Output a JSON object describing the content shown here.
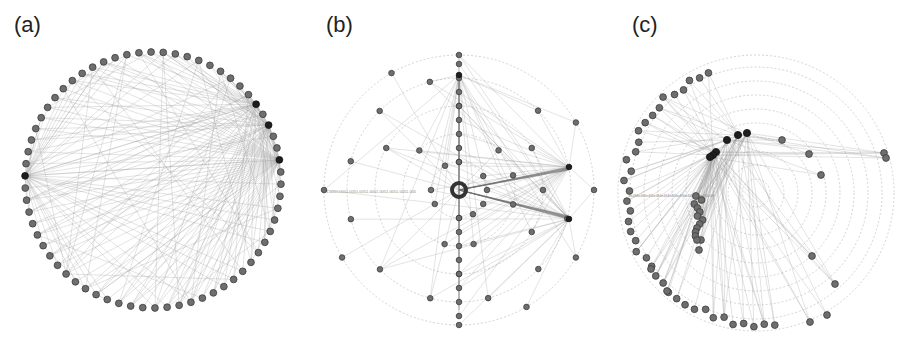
{
  "figure": {
    "panels": [
      {
        "id": "a",
        "label": "(a)",
        "layout": "circular"
      },
      {
        "id": "b",
        "label": "(b)",
        "layout": "radial-concentric"
      },
      {
        "id": "c",
        "label": "(c)",
        "layout": "radial-clustered"
      }
    ]
  },
  "colors": {
    "node": "#6e6e6e",
    "hub": "#1e1e1e",
    "edge": "#9a9a9a",
    "ring": "#c8c8c8",
    "background": "#ffffff"
  },
  "panel_a": {
    "center": [
      153,
      180
    ],
    "radius": 128,
    "node_count": 66,
    "hub_indices": [
      9,
      11,
      14,
      49
    ]
  },
  "panel_b": {
    "center": [
      459,
      190
    ],
    "ring_radii": [
      28,
      56,
      84,
      112,
      135
    ],
    "hubs": [
      [
        459,
        75
      ],
      [
        569,
        167
      ],
      [
        569,
        219
      ]
    ],
    "center_node": [
      459,
      190
    ],
    "axis_tick_text": "1.0051.0051.0051.0051.0051.0051.0051.0051.005"
  },
  "panel_c": {
    "center": [
      756,
      193
    ],
    "ring_radii": [
      14,
      28,
      42,
      56,
      70,
      84,
      98,
      112,
      126,
      138
    ],
    "hub_chain": [
      [
        747,
        133
      ],
      [
        738,
        135
      ],
      [
        727,
        140
      ],
      [
        716,
        152
      ],
      [
        713,
        155
      ],
      [
        710,
        157
      ]
    ],
    "axis_tick_text": "1e4f4e4f4e4f4e4f4e4f4e4f4e4f4e4f4e4f4e4f4e4f"
  }
}
